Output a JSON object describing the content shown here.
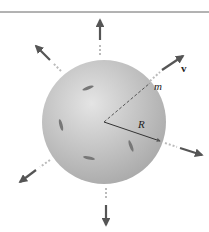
{
  "diagram": {
    "labels": {
      "mass": "m",
      "radius": "R",
      "velocity": "v"
    },
    "colors": {
      "sphere": "#bdbdbd",
      "arrow": "#555555",
      "line": "#444444"
    }
  }
}
